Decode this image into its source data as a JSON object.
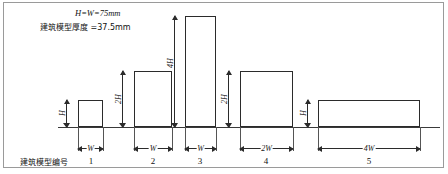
{
  "figure": {
    "notes": [
      {
        "text": "H=W=75mm",
        "x": 75,
        "y": 13
      },
      {
        "text": "建筑模型厚度 =37.5mm",
        "x": 40,
        "y": 26
      }
    ],
    "row_label": "建筑模型编号",
    "baseline": {
      "x": 58,
      "y": 127,
      "width": 382
    },
    "buildings": [
      {
        "id": "1",
        "number": "1",
        "x": 78,
        "y": 100,
        "w": 25,
        "h": 27,
        "height_label": "H",
        "width_label": "W",
        "height_mult": 1,
        "width_mult": 1
      },
      {
        "id": "2",
        "number": "2",
        "x": 134,
        "y": 71,
        "w": 38,
        "h": 56,
        "height_label": "2H",
        "width_label": "W",
        "height_mult": 2,
        "width_mult": 1
      },
      {
        "id": "3",
        "number": "3",
        "x": 185,
        "y": 16,
        "w": 31,
        "h": 111,
        "height_label": "4H",
        "width_label": "W",
        "height_mult": 4,
        "width_mult": 1
      },
      {
        "id": "4",
        "number": "4",
        "x": 240,
        "y": 71,
        "w": 53,
        "h": 56,
        "height_label": "2H",
        "width_label": "2W",
        "height_mult": 2,
        "width_mult": 2
      },
      {
        "id": "5",
        "number": "5",
        "x": 318,
        "y": 100,
        "w": 102,
        "h": 27,
        "height_label": "H",
        "width_label": "4W",
        "height_mult": 1,
        "width_mult": 4
      }
    ],
    "height_dims": [
      {
        "label": "H",
        "x": 66,
        "top": 100,
        "bottom": 127
      },
      {
        "label": "2H",
        "x": 122,
        "top": 71,
        "bottom": 127
      },
      {
        "label": "4H",
        "x": 174,
        "top": 16,
        "bottom": 127
      },
      {
        "label": "2H",
        "x": 228,
        "top": 71,
        "bottom": 127
      },
      {
        "label": "H",
        "x": 307,
        "top": 100,
        "bottom": 127
      }
    ],
    "width_dims": [
      {
        "label": "W",
        "left": 78,
        "right": 103,
        "y": 148
      },
      {
        "label": "W",
        "left": 134,
        "right": 172,
        "y": 148
      },
      {
        "label": "W",
        "left": 185,
        "right": 216,
        "y": 148
      },
      {
        "label": "2W",
        "left": 240,
        "right": 293,
        "y": 148
      },
      {
        "label": "4W",
        "left": 318,
        "right": 420,
        "y": 148
      }
    ],
    "number_labels": [
      {
        "text": "1",
        "x": 91,
        "y": 160
      },
      {
        "text": "2",
        "x": 153,
        "y": 160
      },
      {
        "text": "3",
        "x": 200,
        "y": 160
      },
      {
        "text": "4",
        "x": 266,
        "y": 160
      },
      {
        "text": "5",
        "x": 369,
        "y": 160
      }
    ],
    "row_label_pos": {
      "x": 20,
      "y": 160
    },
    "colors": {
      "stroke": "#2b2b2b",
      "frame": "#9a9a9a",
      "background": "#ffffff",
      "text": "#111111"
    }
  }
}
